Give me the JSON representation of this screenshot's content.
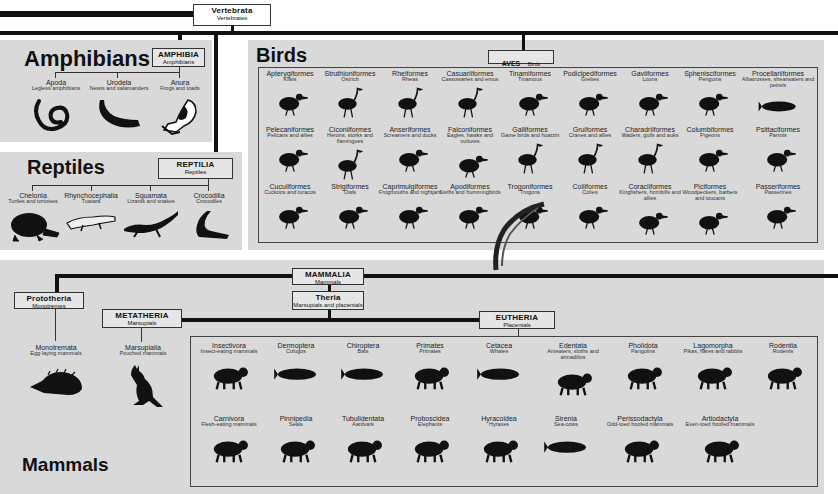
{
  "root": {
    "title": "Vertebrata",
    "subtitle": "Vertebrates"
  },
  "amphibians": {
    "heading": "Amphibians",
    "box": {
      "title": "AMPHIBIA",
      "subtitle": "Amphibians"
    },
    "orders": [
      {
        "name": "Apoda",
        "common": "Legless amphibians",
        "icon": "caecilian-icon"
      },
      {
        "name": "Urodela",
        "common": "Newts and salamanders",
        "icon": "salamander-icon"
      },
      {
        "name": "Anura",
        "common": "Frogs and toads",
        "icon": "frog-icon"
      }
    ]
  },
  "reptiles": {
    "heading": "Reptiles",
    "box": {
      "title": "REPTILIA",
      "subtitle": "Reptiles"
    },
    "orders": [
      {
        "name": "Chelonia",
        "common": "Turtles and tortoises",
        "icon": "tortoise-icon"
      },
      {
        "name": "Rhynchocephalia",
        "common": "Tuatara",
        "icon": "tuatara-icon"
      },
      {
        "name": "Squamata",
        "common": "Lizards and snakes",
        "icon": "lizard-icon"
      },
      {
        "name": "Crocodilia",
        "common": "Crocodiles",
        "icon": "crocodile-icon"
      }
    ]
  },
  "birds": {
    "heading": "Birds",
    "box": {
      "title": "AVES",
      "subtitle": "Birds"
    },
    "orders": [
      {
        "name": "Apterygiformes",
        "common": "Kiwis",
        "icon": "kiwi-icon"
      },
      {
        "name": "Struthioniformes",
        "common": "Ostrich",
        "icon": "ostrich-icon"
      },
      {
        "name": "Rheiformes",
        "common": "Rheas",
        "icon": "rhea-icon"
      },
      {
        "name": "Casuariiformes",
        "common": "Cassowaries and emus",
        "icon": "cassowary-icon"
      },
      {
        "name": "Tinamiformes",
        "common": "Tinamous",
        "icon": "tinamou-icon"
      },
      {
        "name": "Podicipediformes",
        "common": "Grebes",
        "icon": "grebe-icon"
      },
      {
        "name": "Gaviiformes",
        "common": "Loons",
        "icon": "loon-icon"
      },
      {
        "name": "Sphenisciformes",
        "common": "Penguins",
        "icon": "penguin-icon"
      },
      {
        "name": "Procellariiformes",
        "common": "Albatrosses, shearwaters and petrels",
        "icon": "albatross-icon"
      },
      {
        "name": "Pelecaniformes",
        "common": "Pelicans and allies",
        "icon": "pelican-icon"
      },
      {
        "name": "Ciconiiformes",
        "common": "Herons, storks and flamingoes",
        "icon": "stork-icon"
      },
      {
        "name": "Anseriformes",
        "common": "Screamers and ducks",
        "icon": "goose-icon"
      },
      {
        "name": "Falconiformes",
        "common": "Eagles, hawks and vultures",
        "icon": "eagle-icon"
      },
      {
        "name": "Galliformes",
        "common": "Game birds and hoatzin",
        "icon": "peacock-icon"
      },
      {
        "name": "Gruiformes",
        "common": "Cranes and allies",
        "icon": "crane-icon"
      },
      {
        "name": "Charadriiformes",
        "common": "Waders, gulls and auks",
        "icon": "oystercatcher-icon"
      },
      {
        "name": "Columbiformes",
        "common": "Pigeons",
        "icon": "pigeon-icon"
      },
      {
        "name": "Psittaciformes",
        "common": "Parrots",
        "icon": "parrot-icon"
      },
      {
        "name": "Cuculiformes",
        "common": "Cuckoos and turacos",
        "icon": "cuckoo-icon"
      },
      {
        "name": "Strigiformes",
        "common": "Owls",
        "icon": "owl-icon"
      },
      {
        "name": "Caprimulgiformes",
        "common": "Frogmouths and nightjars",
        "icon": "nightjar-icon"
      },
      {
        "name": "Apodiformes",
        "common": "Swifts and hummingbirds",
        "icon": "hummingbird-icon"
      },
      {
        "name": "Trogoniformes",
        "common": "Trogons",
        "icon": "quetzal-icon"
      },
      {
        "name": "Coliiformes",
        "common": "Colies",
        "icon": "mousebird-icon"
      },
      {
        "name": "Coraciiformes",
        "common": "Kingfishers, hornbills and allies",
        "icon": "hornbill-icon"
      },
      {
        "name": "Piciformes",
        "common": "Woodpeckers, barbets and toucans",
        "icon": "woodpecker-icon"
      },
      {
        "name": "Passeriformes",
        "common": "Passerines",
        "icon": "waxwing-icon"
      }
    ]
  },
  "mammals": {
    "heading": "Mammals",
    "box": {
      "title": "MAMMALIA",
      "subtitle": "Mammals"
    },
    "theria": {
      "title": "Theria",
      "subtitle": "Marsupials and placentals"
    },
    "prototheria": {
      "box": {
        "title": "Prototheria",
        "subtitle": "Monotremes"
      },
      "order": {
        "name": "Monotremata",
        "common": "Egg-laying mammals",
        "icon": "echidna-icon"
      }
    },
    "metatheria": {
      "box": {
        "title": "METATHERIA",
        "subtitle": "Marsupials"
      },
      "order": {
        "name": "Marsupialia",
        "common": "Pouched mammals",
        "icon": "kangaroo-icon"
      }
    },
    "eutheria": {
      "box": {
        "title": "EUTHERIA",
        "subtitle": "Placentals"
      },
      "orders": [
        {
          "name": "Insectivora",
          "common": "Insect-eating mammals",
          "icon": "shrew-icon"
        },
        {
          "name": "Dermoptera",
          "common": "Colugos",
          "icon": "colugo-icon"
        },
        {
          "name": "Chiroptera",
          "common": "Bats",
          "icon": "bat-icon"
        },
        {
          "name": "Primates",
          "common": "Primates",
          "icon": "monkey-icon"
        },
        {
          "name": "Cetacea",
          "common": "Whales",
          "icon": "whale-icon"
        },
        {
          "name": "Edentata",
          "common": "Anteaters, sloths and armadillos",
          "icon": "armadillo-icon"
        },
        {
          "name": "Pholidota",
          "common": "Pangolins",
          "icon": "pangolin-icon"
        },
        {
          "name": "Lagomorpha",
          "common": "Pikas, hares and rabbits",
          "icon": "rabbit-icon"
        },
        {
          "name": "Rodentia",
          "common": "Rodents",
          "icon": "chipmunk-icon"
        },
        {
          "name": "Carnivora",
          "common": "Flesh-eating mammals",
          "icon": "jackal-icon"
        },
        {
          "name": "Pinnipedia",
          "common": "Seals",
          "icon": "seal-icon"
        },
        {
          "name": "Tubulidentata",
          "common": "Aardvark",
          "icon": "aardvark-icon"
        },
        {
          "name": "Proboscidea",
          "common": "Elephants",
          "icon": "elephant-icon"
        },
        {
          "name": "Hyracoidea",
          "common": "Hyraxes",
          "icon": "hyrax-icon"
        },
        {
          "name": "Sirenia",
          "common": "Sea-cows",
          "icon": "dugong-icon"
        },
        {
          "name": "Perissodactyla",
          "common": "Odd-toed hoofed mammals",
          "icon": "tapir-icon"
        },
        {
          "name": "Artiodactyla",
          "common": "Even-toed hoofed mammals",
          "icon": "antelope-icon"
        }
      ]
    }
  },
  "colors": {
    "panel": "#d9d9d9",
    "line": "#111111",
    "box": "#e6e6e6",
    "background": "#ffffff"
  }
}
